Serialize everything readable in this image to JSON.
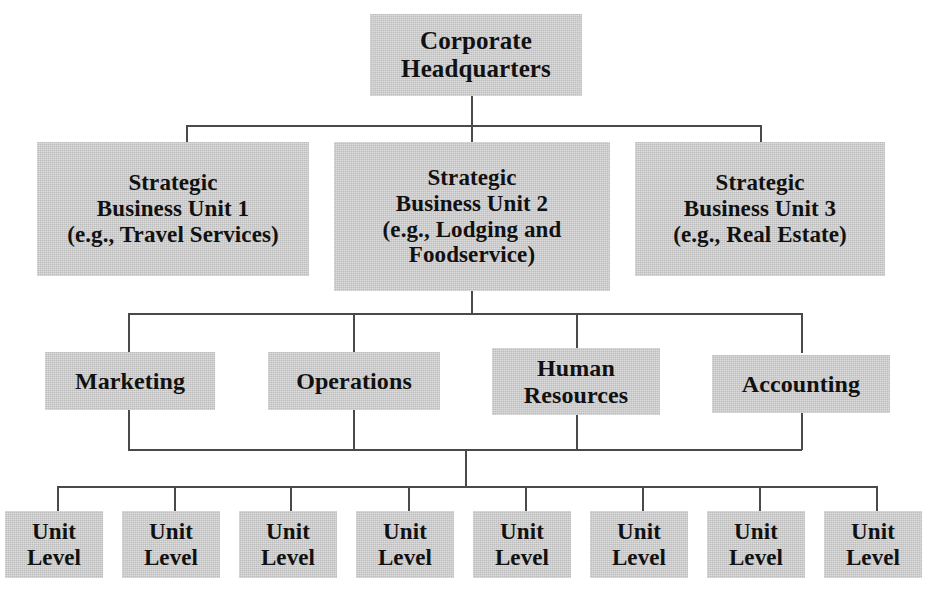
{
  "diagram": {
    "type": "organizational-chart",
    "box_fill_color": "#c9c9c9",
    "line_color": "#4a4a4a",
    "text_color": "#111111",
    "levels": [
      {
        "name": "corporate",
        "nodes": [
          {
            "id": "hq",
            "label": "Corporate\nHeadquarters"
          }
        ]
      },
      {
        "name": "strategic-business-units",
        "nodes": [
          {
            "id": "sbu1",
            "label": "Strategic\nBusiness Unit 1\n(e.g., Travel Services)"
          },
          {
            "id": "sbu2",
            "label": "Strategic\nBusiness Unit 2\n(e.g., Lodging and\nFoodservice)"
          },
          {
            "id": "sbu3",
            "label": "Strategic\nBusiness Unit 3\n(e.g., Real Estate)"
          }
        ]
      },
      {
        "name": "functional-departments",
        "nodes": [
          {
            "id": "marketing",
            "label": "Marketing"
          },
          {
            "id": "operations",
            "label": "Operations"
          },
          {
            "id": "human-resources",
            "label": "Human\nResources"
          },
          {
            "id": "accounting",
            "label": "Accounting"
          }
        ]
      },
      {
        "name": "unit-level",
        "nodes": [
          {
            "id": "unit1",
            "label": "Unit\nLevel"
          },
          {
            "id": "unit2",
            "label": "Unit\nLevel"
          },
          {
            "id": "unit3",
            "label": "Unit\nLevel"
          },
          {
            "id": "unit4",
            "label": "Unit\nLevel"
          },
          {
            "id": "unit5",
            "label": "Unit\nLevel"
          },
          {
            "id": "unit6",
            "label": "Unit\nLevel"
          },
          {
            "id": "unit7",
            "label": "Unit\nLevel"
          },
          {
            "id": "unit8",
            "label": "Unit\nLevel"
          }
        ]
      }
    ]
  }
}
